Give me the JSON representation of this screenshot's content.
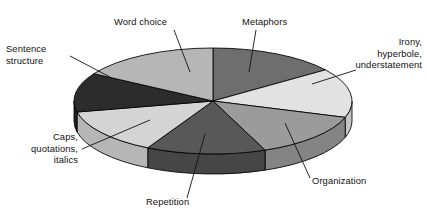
{
  "chart_data": {
    "type": "pie",
    "title": "",
    "subtitle": "",
    "xlabel": "",
    "ylabel": "",
    "legend_position": "none",
    "grid": false,
    "style": "3d-exploded-grayscale",
    "geometry": {
      "center_x": 213,
      "center_y": 101,
      "radius_x": 139,
      "radius_y": 53,
      "depth": 20,
      "start_angle_deg": -90,
      "direction": "clockwise"
    },
    "categories": [
      "Metaphors",
      "Irony, hyperbole, understatement",
      "Organization",
      "Repetition",
      "Caps, quotations, italics",
      "Sentence structure",
      "Word choice"
    ],
    "values": [
      15,
      15,
      14,
      14,
      14,
      12,
      16
    ],
    "colors": [
      "#6e6e6e",
      "#e2e2e2",
      "#9b9b9b",
      "#585858",
      "#d4d4d4",
      "#2c2c2c",
      "#b6b6b6"
    ],
    "slices": [
      {
        "label": "Metaphors",
        "value": 15,
        "start_deg": -90,
        "end_deg": -36,
        "color": "#6e6e6e",
        "side_color": "#5a5a5a"
      },
      {
        "label": "Irony, hyperbole, understatement",
        "value": 15,
        "start_deg": -36,
        "end_deg": 18,
        "color": "#e2e2e2",
        "side_color": "#c4c4c4"
      },
      {
        "label": "Organization",
        "value": 14,
        "start_deg": 18,
        "end_deg": 68,
        "color": "#9b9b9b",
        "side_color": "#848484"
      },
      {
        "label": "Repetition",
        "value": 14,
        "start_deg": 68,
        "end_deg": 118,
        "color": "#585858",
        "side_color": "#464646"
      },
      {
        "label": "Caps, quotations, italics",
        "value": 14,
        "start_deg": 118,
        "end_deg": 168,
        "color": "#d4d4d4",
        "side_color": "#b6b6b6"
      },
      {
        "label": "Sentence structure",
        "value": 12,
        "start_deg": 168,
        "end_deg": 211,
        "color": "#2c2c2c",
        "side_color": "#222222"
      },
      {
        "label": "Word choice",
        "value": 16,
        "start_deg": 211,
        "end_deg": 270,
        "color": "#b6b6b6",
        "side_color": "#9a9a9a"
      }
    ],
    "annotations": [
      {
        "name": "word-choice",
        "lines": [
          "Word choice"
        ],
        "text_x": 114,
        "text_y": 25,
        "anchor": "start",
        "leader": "M 174 30 L 190 72"
      },
      {
        "name": "metaphors",
        "lines": [
          "Metaphors"
        ],
        "text_x": 242,
        "text_y": 25,
        "anchor": "start",
        "leader": "M 256 30 L 249 72"
      },
      {
        "name": "irony-hyperbole-understatement",
        "lines": [
          "Irony,",
          "hyperbole,",
          "understatement"
        ],
        "text_x": 422,
        "text_y": 45,
        "anchor": "end",
        "leader": "M 356 70 L 312 84"
      },
      {
        "name": "organization",
        "lines": [
          "Organization"
        ],
        "text_x": 312,
        "text_y": 184,
        "anchor": "start",
        "leader": "M 310 178 L 285 123"
      },
      {
        "name": "repetition",
        "lines": [
          "Repetition"
        ],
        "text_x": 146,
        "text_y": 205,
        "anchor": "start",
        "leader": "M 187 198 L 205 134"
      },
      {
        "name": "caps-quotations-italics",
        "lines": [
          "Caps,",
          "quotations,",
          "italics"
        ],
        "text_x": 78,
        "text_y": 140,
        "anchor": "end",
        "leader": "M 82 149 L 150 120"
      },
      {
        "name": "sentence-structure",
        "lines": [
          "Sentence",
          "structure"
        ],
        "text_x": 6,
        "text_y": 52,
        "anchor": "start",
        "leader": "M 70 56 L 110 77"
      }
    ]
  }
}
